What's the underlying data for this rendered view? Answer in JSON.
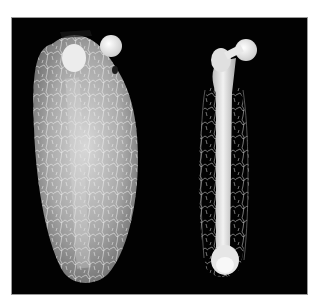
{
  "figure": {
    "background_color": "#ffffff",
    "panel_color": "#020202",
    "specimens": [
      {
        "name": "femur-with-surrounding-tissue-and-vasculature",
        "position": "left"
      },
      {
        "name": "isolated-femur-with-vascular-network",
        "position": "right"
      }
    ]
  }
}
